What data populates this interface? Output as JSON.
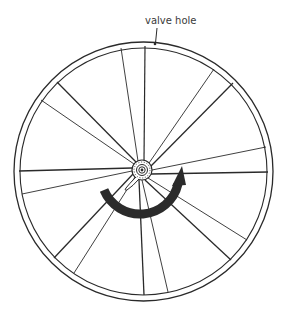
{
  "diagram": {
    "labels": {
      "valve_hole": "valve hole"
    },
    "spoke_count": 16,
    "rotation_direction": "clockwise",
    "colors": {
      "line": "#2a2a2a",
      "arrow": "#2b2b2b",
      "background": "#ffffff"
    }
  }
}
